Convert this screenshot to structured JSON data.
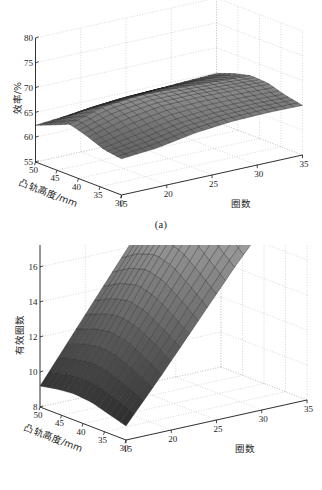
{
  "figure": {
    "background": "#ffffff",
    "ink": "#1d1d1d",
    "grid_color": "#b9b9b9",
    "panels": [
      {
        "id": "a",
        "caption": "(a)"
      },
      {
        "id": "b",
        "caption": "(b)"
      }
    ]
  },
  "chart_data": [
    {
      "type": "surface",
      "panel": "(a)",
      "title": "",
      "xlabel": "凸轨高度/mm",
      "ylabel": "圈数",
      "zlabel": "效率/%",
      "grid": true,
      "legend": "none",
      "colormap": "gray",
      "xlim": [
        30,
        50
      ],
      "ylim": [
        15,
        35
      ],
      "zlim": [
        55,
        80
      ],
      "xticks": [
        50,
        45,
        40,
        35,
        30
      ],
      "yticks": [
        15,
        20,
        25,
        30,
        35
      ],
      "zticks": [
        55,
        60,
        65,
        70,
        75,
        80
      ],
      "x": [
        50,
        46,
        42,
        38,
        34,
        30
      ],
      "y": [
        15,
        19,
        23,
        27,
        31,
        35
      ],
      "z": [
        [
          62.4,
          63.0,
          63.6,
          64.1,
          64.5,
          64.8
        ],
        [
          63.8,
          65.6,
          66.2,
          66.4,
          66.3,
          66.1
        ],
        [
          65.3,
          67.4,
          68.0,
          67.8,
          67.4,
          67.0
        ],
        [
          64.2,
          66.1,
          67.2,
          67.3,
          67.1,
          66.8
        ],
        [
          62.8,
          64.0,
          65.4,
          65.9,
          65.9,
          65.7
        ],
        [
          62.3,
          62.9,
          64.2,
          64.9,
          65.1,
          65.0
        ]
      ],
      "annotations": [
        "曲面在凸轨高度约40–45 mm、圈数20–25处出现脊状极大值"
      ]
    },
    {
      "type": "surface",
      "panel": "(b)",
      "title": "",
      "xlabel": "凸轨高度/mm",
      "ylabel": "圈数",
      "zlabel": "有效圈数",
      "grid": true,
      "legend": "none",
      "colormap": "gray",
      "xlim": [
        30,
        50
      ],
      "ylim": [
        15,
        35
      ],
      "zlim": [
        8,
        24
      ],
      "xticks": [
        50,
        45,
        40,
        35,
        30
      ],
      "yticks": [
        15,
        20,
        25,
        30,
        35
      ],
      "zticks": [
        8,
        10,
        12,
        14,
        16,
        18,
        20,
        22,
        24
      ],
      "x": [
        50,
        46,
        42,
        38,
        34,
        30
      ],
      "y": [
        15,
        19,
        23,
        27,
        31,
        35
      ],
      "z": [
        [
          9.2,
          12.0,
          14.8,
          17.6,
          20.2,
          22.4
        ],
        [
          9.4,
          12.4,
          15.4,
          18.3,
          20.9,
          23.0
        ],
        [
          9.5,
          12.6,
          15.7,
          18.6,
          21.2,
          23.2
        ],
        [
          9.4,
          12.4,
          15.4,
          18.3,
          20.8,
          22.9
        ],
        [
          9.1,
          11.9,
          14.7,
          17.4,
          19.9,
          22.1
        ],
        [
          8.8,
          11.3,
          13.9,
          16.5,
          18.9,
          21.2
        ]
      ],
      "annotations": [
        "有效圈数随圈数近似线性增大，随凸轨高度变化较小"
      ]
    }
  ],
  "panel_a": {
    "caption": "(a)",
    "zlabel": "效率/%",
    "xlabel": "凸轨高度/mm",
    "ylabel": "圈数",
    "zticks": [
      "80",
      "75",
      "70",
      "65",
      "60",
      "55"
    ],
    "xticks": [
      "50",
      "45",
      "40",
      "35",
      "30"
    ],
    "yticks": [
      "15",
      "20",
      "25",
      "30",
      "35"
    ]
  },
  "panel_b": {
    "caption": "(b)",
    "zlabel": "有效圈数",
    "xlabel": "凸轨高度/mm",
    "ylabel": "圈数",
    "zticks": [
      "24",
      "22",
      "20",
      "18",
      "16",
      "14",
      "12",
      "10",
      "8"
    ],
    "xticks": [
      "50",
      "45",
      "40",
      "35",
      "30"
    ],
    "yticks": [
      "15",
      "20",
      "25",
      "30",
      "35"
    ]
  }
}
